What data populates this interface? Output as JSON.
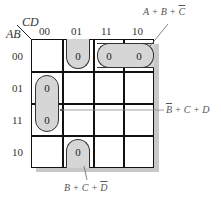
{
  "kmap": {
    "row_var": "AB",
    "col_var": "CD",
    "col_labels": [
      "00",
      "01",
      "11",
      "10"
    ],
    "row_labels": [
      "00",
      "01",
      "11",
      "10"
    ],
    "cells": [
      [
        "",
        "0",
        "0",
        "0"
      ],
      [
        "0",
        "",
        "",
        ""
      ],
      [
        "0",
        "",
        "",
        ""
      ],
      [
        "",
        "0",
        "",
        ""
      ]
    ],
    "zero_value": "0"
  },
  "groups": [
    {
      "label_parts": [
        "A + B + ",
        "C"
      ],
      "overlined_part": 1,
      "cells": "row 00, cols 11-10"
    },
    {
      "label_parts": [
        "B",
        " + C + D"
      ],
      "overlined_part": 0,
      "cells": "col 00, rows 01-11"
    },
    {
      "label_parts": [
        "B + C + ",
        "D"
      ],
      "overlined_part": 1,
      "cells": "col 01, rows 00 and 10 (wraparound)"
    }
  ],
  "colors": {
    "loop_fill": "#d6d6d6",
    "grid_line": "#111111",
    "shadow": "#c8c8c8"
  }
}
